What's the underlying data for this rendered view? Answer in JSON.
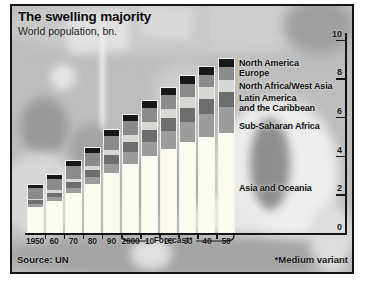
{
  "chart_data": {
    "type": "bar",
    "stacked": true,
    "title": "The swelling majority",
    "subtitle": "World population, bn.",
    "categories": [
      "1950",
      "60",
      "70",
      "80",
      "90",
      "2000",
      "10",
      "20",
      "30",
      "40",
      "50"
    ],
    "series": [
      {
        "name": "Asia and Oceania",
        "legend_lines": [
          "Asia and Oceania"
        ],
        "color": "#fbfbf1",
        "values": [
          1.34,
          1.64,
          2.08,
          2.52,
          3.1,
          3.58,
          3.97,
          4.36,
          4.68,
          4.95,
          5.15
        ]
      },
      {
        "name": "Sub-Saharan Africa",
        "legend_lines": [
          "Sub-Saharan Africa"
        ],
        "color": "#9c9c9c",
        "values": [
          0.17,
          0.21,
          0.27,
          0.36,
          0.47,
          0.6,
          0.75,
          0.91,
          1.07,
          1.22,
          1.36
        ]
      },
      {
        "name": "Latin America and the Caribbean",
        "legend_lines": [
          "Latin America",
          "and the Caribbean"
        ],
        "color": "#6e6e6e",
        "values": [
          0.17,
          0.22,
          0.29,
          0.36,
          0.44,
          0.52,
          0.59,
          0.65,
          0.7,
          0.74,
          0.77
        ]
      },
      {
        "name": "North Africa/West Asia",
        "legend_lines": [
          "North Africa/West Asia"
        ],
        "color": "#d7d7d3",
        "values": [
          0.1,
          0.13,
          0.17,
          0.22,
          0.29,
          0.36,
          0.43,
          0.5,
          0.56,
          0.61,
          0.65
        ]
      },
      {
        "name": "Europe",
        "legend_lines": [
          "Europe"
        ],
        "color": "#8b8b8b",
        "values": [
          0.55,
          0.6,
          0.66,
          0.69,
          0.72,
          0.73,
          0.72,
          0.71,
          0.69,
          0.66,
          0.63
        ]
      },
      {
        "name": "North America",
        "legend_lines": [
          "North America"
        ],
        "color": "#181818",
        "values": [
          0.17,
          0.2,
          0.23,
          0.25,
          0.28,
          0.31,
          0.34,
          0.37,
          0.4,
          0.42,
          0.44
        ]
      }
    ],
    "totals": [
      2.5,
      3.0,
      3.7,
      4.4,
      5.3,
      6.1,
      6.8,
      7.5,
      8.1,
      8.6,
      9.0
    ],
    "ylim": [
      0,
      10
    ],
    "yticks": [
      10,
      8,
      6,
      4,
      2,
      0
    ],
    "grid": false,
    "legend_position": "right of final bar, labels aligned to its segments",
    "forecast": {
      "label": "Forecast*",
      "from_category": "2000",
      "to_category": "50"
    },
    "source": "Source: UN",
    "note": "*Medium variant"
  }
}
